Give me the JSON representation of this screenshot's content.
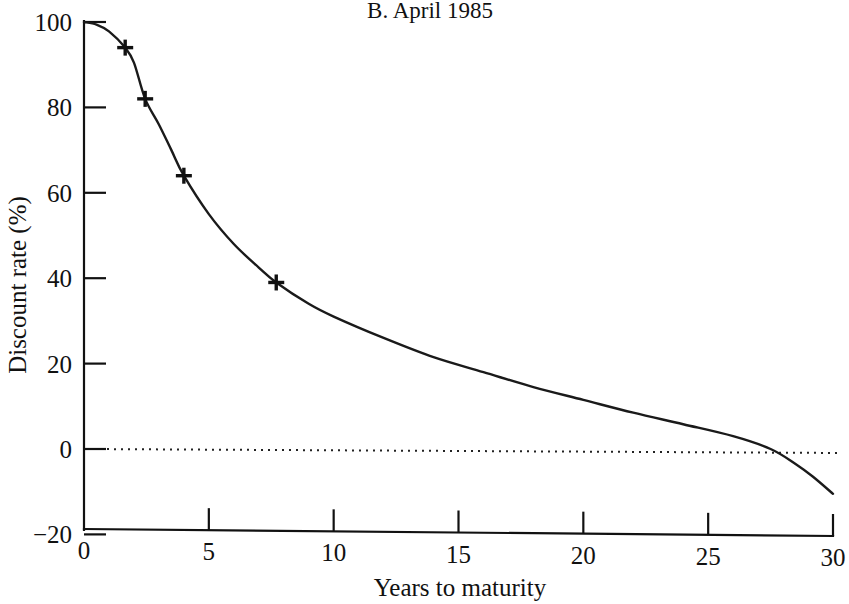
{
  "chart_data": {
    "type": "line",
    "title": "B.  April 1985",
    "xlabel": "Years to maturity",
    "ylabel": "Discount rate (%)",
    "xlim": [
      0,
      30
    ],
    "ylim": [
      -20,
      100
    ],
    "xticks": [
      "0",
      "5",
      "10",
      "15",
      "20",
      "25",
      "30"
    ],
    "xtick_values": [
      0,
      5,
      10,
      15,
      20,
      25,
      30
    ],
    "yticks": [
      "100",
      "80",
      "60",
      "40",
      "20",
      "0",
      "−20"
    ],
    "ytick_values": [
      100,
      80,
      60,
      40,
      20,
      0,
      -20
    ],
    "grid": false,
    "legend": "none",
    "series": [
      {
        "name": "Discount rate",
        "marker": "plus",
        "line_color": "#1a1a1a",
        "x": [
          0,
          1.65,
          2.45,
          4.0,
          7.7
        ],
        "values": [
          100,
          94,
          82,
          64,
          39
        ],
        "marker_points": [
          {
            "x": 0,
            "y": 100
          },
          {
            "x": 1.65,
            "y": 94
          },
          {
            "x": 2.45,
            "y": 82
          },
          {
            "x": 4.0,
            "y": 64
          },
          {
            "x": 7.7,
            "y": 39
          }
        ],
        "curve_points": [
          {
            "x": 0.0,
            "y": 100.0
          },
          {
            "x": 0.5,
            "y": 99.4
          },
          {
            "x": 1.0,
            "y": 97.8
          },
          {
            "x": 1.65,
            "y": 94.0
          },
          {
            "x": 2.0,
            "y": 90.5
          },
          {
            "x": 2.45,
            "y": 82.0
          },
          {
            "x": 3.0,
            "y": 76.0
          },
          {
            "x": 3.5,
            "y": 70.0
          },
          {
            "x": 4.0,
            "y": 64.0
          },
          {
            "x": 5.0,
            "y": 55.0
          },
          {
            "x": 6.0,
            "y": 48.0
          },
          {
            "x": 7.0,
            "y": 42.5
          },
          {
            "x": 7.7,
            "y": 39.0
          },
          {
            "x": 9.0,
            "y": 34.0
          },
          {
            "x": 10.0,
            "y": 31.0
          },
          {
            "x": 12.0,
            "y": 26.0
          },
          {
            "x": 14.0,
            "y": 21.5
          },
          {
            "x": 16.0,
            "y": 18.0
          },
          {
            "x": 18.0,
            "y": 14.5
          },
          {
            "x": 20.0,
            "y": 11.5
          },
          {
            "x": 22.0,
            "y": 8.5
          },
          {
            "x": 24.0,
            "y": 5.8
          },
          {
            "x": 26.0,
            "y": 3.0
          },
          {
            "x": 27.5,
            "y": 0.0
          },
          {
            "x": 28.5,
            "y": -3.5
          },
          {
            "x": 29.2,
            "y": -6.5
          },
          {
            "x": 30.0,
            "y": -10.5
          }
        ]
      }
    ],
    "reference_lines": [
      {
        "name": "zero-line",
        "orientation": "horizontal",
        "value": 0,
        "style": "dotted"
      }
    ]
  }
}
